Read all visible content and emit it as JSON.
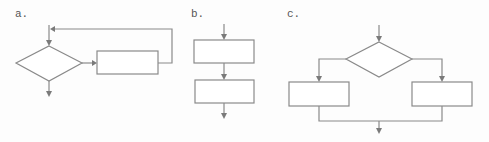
{
  "diagrams": [
    {
      "id": "a",
      "label": "a.",
      "type": "while-loop",
      "elements": [
        "decision-diamond",
        "process-box",
        "loop-back-arrow",
        "exit-arrow"
      ]
    },
    {
      "id": "b",
      "label": "b.",
      "type": "sequence",
      "elements": [
        "process-box",
        "process-box"
      ]
    },
    {
      "id": "c",
      "label": "c.",
      "type": "if-else",
      "elements": [
        "decision-diamond",
        "process-box-left",
        "process-box-right",
        "merge-arrow"
      ]
    }
  ],
  "colors": {
    "line": "#8a8a8a",
    "arrowhead": "#7a7a7a",
    "background": "#fdfdfd",
    "label": "#555555"
  }
}
